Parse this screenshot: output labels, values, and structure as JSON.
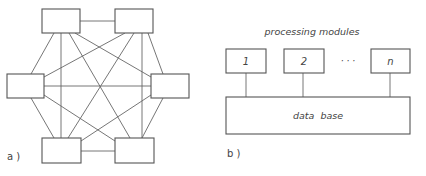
{
  "panel_a": {
    "label": "a )",
    "nodes": [
      {
        "id": "top-left",
        "x": 42,
        "y": 9,
        "w": 38,
        "h": 24
      },
      {
        "id": "top-right",
        "x": 115,
        "y": 9,
        "w": 38,
        "h": 24
      },
      {
        "id": "left",
        "x": 7,
        "y": 74,
        "w": 37,
        "h": 24
      },
      {
        "id": "right",
        "x": 151,
        "y": 74,
        "w": 38,
        "h": 24
      },
      {
        "id": "bottom-left",
        "x": 42,
        "y": 138,
        "w": 39,
        "h": 25
      },
      {
        "id": "bottom-right",
        "x": 115,
        "y": 138,
        "w": 39,
        "h": 25
      }
    ],
    "edges": [
      [
        80,
        21,
        115,
        21
      ],
      [
        81,
        151,
        115,
        151
      ],
      [
        44,
        86,
        151,
        86
      ],
      [
        54,
        33,
        31,
        74
      ],
      [
        61,
        33,
        61,
        138
      ],
      [
        69,
        33,
        130,
        138
      ],
      [
        75,
        33,
        151,
        77
      ],
      [
        125,
        33,
        44,
        77
      ],
      [
        134,
        33,
        68,
        138
      ],
      [
        142,
        33,
        142,
        138
      ],
      [
        148,
        33,
        163,
        74
      ],
      [
        31,
        98,
        54,
        138
      ],
      [
        44,
        95,
        115,
        141
      ],
      [
        151,
        95,
        81,
        141
      ],
      [
        163,
        98,
        142,
        138
      ]
    ]
  },
  "panel_b": {
    "label": "b )",
    "title": "processing modules",
    "modules": [
      {
        "label": "1",
        "x": 226,
        "y": 49,
        "w": 40,
        "h": 24,
        "connector_x": 246
      },
      {
        "label": "2",
        "x": 284,
        "y": 49,
        "w": 40,
        "h": 24,
        "connector_x": 303
      },
      {
        "label": "n",
        "x": 371,
        "y": 49,
        "w": 39,
        "h": 24,
        "connector_x": 390
      }
    ],
    "ellipsis": "· · ·",
    "database": {
      "label": "data  base",
      "x": 226,
      "y": 97,
      "w": 184,
      "h": 37
    }
  }
}
